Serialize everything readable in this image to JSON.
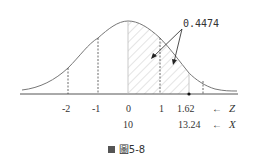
{
  "figure": {
    "annotation": "0.4474",
    "z_axis_label": "Z",
    "x_axis_label": "X",
    "z_ticks": [
      "-2",
      "-1",
      "0",
      "1",
      "1.62"
    ],
    "x_ticks": [
      "10",
      "13.24"
    ],
    "caption": "圖5-8",
    "arrow_glyph": "←"
  },
  "colors": {
    "curve": "#777777",
    "axis": "#555555",
    "hatch": "#bbbbbb",
    "text": "#333333"
  }
}
